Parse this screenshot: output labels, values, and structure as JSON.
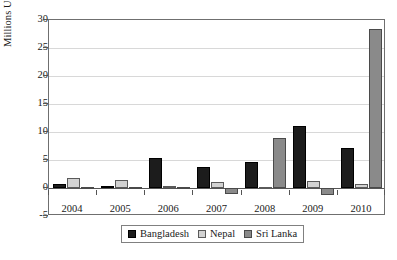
{
  "chart_data": {
    "type": "bar",
    "title": "",
    "subtitle": "",
    "xlabel": "",
    "ylabel": "Millions US$",
    "categories": [
      "2004",
      "2005",
      "2006",
      "2007",
      "2008",
      "2009",
      "2010"
    ],
    "series": [
      {
        "name": "Bangladesh",
        "color": "#1c1c1c",
        "values": [
          0.8,
          0.3,
          5.3,
          3.8,
          4.6,
          11.0,
          7.2
        ]
      },
      {
        "name": "Nepal",
        "color": "#d2d2d2",
        "values": [
          1.7,
          1.4,
          0.3,
          1.0,
          0.2,
          1.3,
          0.8
        ]
      },
      {
        "name": "Sri Lanka",
        "color": "#8a8a8a",
        "values": [
          0.1,
          0.1,
          0.2,
          -1.0,
          9.0,
          -1.2,
          28.4
        ]
      }
    ],
    "ylim": [
      -5,
      30
    ],
    "ytick_values": [
      30,
      25,
      20,
      15,
      10,
      5,
      0,
      -5
    ],
    "ytick_labels": [
      "30",
      "25",
      "20",
      "15",
      "10",
      "5",
      "0",
      "-5"
    ],
    "grid": true,
    "grid_axis": "y",
    "legend_position": "bottom-center",
    "legend_labels": [
      "Bangladesh",
      "Nepal",
      "Sri Lanka"
    ]
  }
}
